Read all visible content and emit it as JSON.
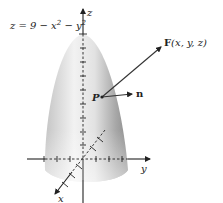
{
  "figure": {
    "surface_equation": {
      "prefix": "z = 9 − x",
      "exp1": "2",
      "mid": " − y",
      "exp2": "2"
    },
    "axes": {
      "z_label": "z",
      "y_label": "y",
      "x_label": "x"
    },
    "point_label": "P",
    "normal_label": "n",
    "field_label": {
      "bold": "F",
      "args": "(x, y, z)"
    },
    "colors": {
      "surface_light": "#f4f4f4",
      "surface_mid": "#d6d6d6",
      "surface_dark": "#9a9a9a",
      "ink": "#222222"
    }
  }
}
